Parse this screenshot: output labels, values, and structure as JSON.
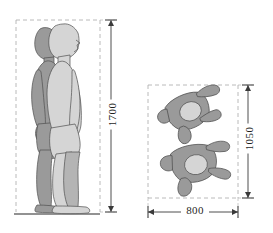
{
  "diagram": {
    "units": "mm",
    "colors": {
      "figure_back": "#9a9a9a",
      "figure_front": "#d5d5d5",
      "figure_mid": "#b4b4b4",
      "outline": "#4f4f4f",
      "dashed_box": "#a8a8a8",
      "dimension_line": "#3a3a3a",
      "ground_line": "#6e6e6e",
      "background": "#ffffff",
      "text": "#1f1f1f"
    },
    "views": [
      {
        "name": "side-elevation",
        "label": "Side elevation of standing figures",
        "figure_count": 2,
        "has_ground_line": true,
        "bounding_box": {
          "x": 16,
          "y": 20,
          "width": 84,
          "height": 192
        }
      },
      {
        "name": "plan-view",
        "label": "Plan view of lying figures",
        "figure_count": 2,
        "has_ground_line": false,
        "bounding_box": {
          "x": 148,
          "y": 85,
          "width": 90,
          "height": 113
        }
      }
    ],
    "dimensions": [
      {
        "name": "height",
        "value": "1700",
        "orientation": "vertical",
        "view": "side-elevation"
      },
      {
        "name": "depth",
        "value": "1050",
        "orientation": "vertical",
        "view": "plan-view"
      },
      {
        "name": "width",
        "value": "800",
        "orientation": "horizontal",
        "view": "plan-view"
      }
    ]
  }
}
